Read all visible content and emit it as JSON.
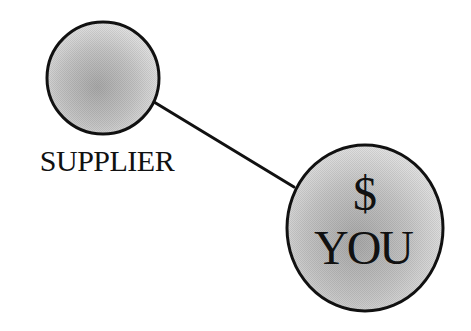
{
  "diagram": {
    "nodes": [
      {
        "id": "supplier",
        "label": "SUPPLIER",
        "cx": 103,
        "cy": 78,
        "r": 56
      },
      {
        "id": "you",
        "symbol": "$",
        "label": "YOU",
        "cx": 365,
        "cy": 228,
        "r": 79
      }
    ],
    "edges": [
      {
        "from": "supplier",
        "to": "you",
        "x1": 154,
        "y1": 102,
        "x2": 294,
        "y2": 187
      }
    ],
    "colors": {
      "stroke": "#111111",
      "fill_light": "#e2e2e2",
      "fill_mid": "#c4c4c4",
      "fill_dark": "#a9a9a9",
      "text": "#111111"
    }
  }
}
